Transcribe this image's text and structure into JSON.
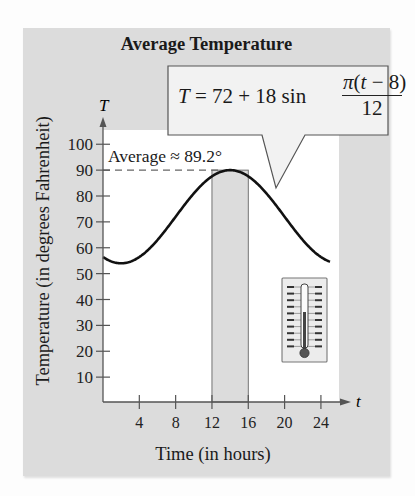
{
  "chart_data": {
    "type": "line",
    "title": "Average Temperature",
    "xlabel": "Time (in hours)",
    "ylabel": "Temperature (in degrees Fahrenheit)",
    "x_axis_symbol": "t",
    "y_axis_symbol": "T",
    "xlim": [
      0,
      26
    ],
    "ylim": [
      0,
      105
    ],
    "x_ticks": [
      4,
      8,
      12,
      16,
      20,
      24
    ],
    "y_ticks": [
      10,
      20,
      30,
      40,
      50,
      60,
      70,
      80,
      90,
      100
    ],
    "equation": "T = 72 + 18 sin(π(t − 8)/12)",
    "series": [
      {
        "name": "T(t)",
        "x": [
          0,
          2,
          4,
          6,
          8,
          10,
          12,
          14,
          16,
          18,
          20,
          22,
          24
        ],
        "values": [
          56.4,
          54.0,
          56.4,
          63.0,
          72.0,
          81.0,
          87.6,
          90.0,
          87.6,
          81.0,
          72.0,
          63.0,
          56.4
        ]
      }
    ],
    "annotations": [
      {
        "type": "hline",
        "y": 89.2,
        "label": "Average ≈ 89.2°",
        "style": "dashed"
      },
      {
        "type": "shaded_band",
        "x_range": [
          12,
          16
        ]
      },
      {
        "type": "callout",
        "text": "T = 72 + 18 sin π(t − 8)/12"
      },
      {
        "type": "icon",
        "name": "thermometer"
      }
    ],
    "grid": false,
    "legend": null
  },
  "title": "Average Temperature",
  "axes": {
    "xlabel": "Time (in hours)",
    "ylabel": "Temperature (in degrees Fahrenheit)",
    "x_symbol": "t",
    "y_symbol": "T",
    "x_ticks": [
      "4",
      "8",
      "12",
      "16",
      "20",
      "24"
    ],
    "y_ticks": [
      "10",
      "20",
      "30",
      "40",
      "50",
      "60",
      "70",
      "80",
      "90",
      "100"
    ]
  },
  "callout": {
    "lhs": "T = 72 + 18 sin ",
    "numerator": "π(t − 8)",
    "denominator": "12"
  },
  "average_label": "Average ≈ 89.2°",
  "colors": {
    "panel": "#dcdcdc",
    "plot_bg": "#ffffff",
    "band": "#dcdcdc",
    "curve": "#111111",
    "axis": "#555555"
  }
}
